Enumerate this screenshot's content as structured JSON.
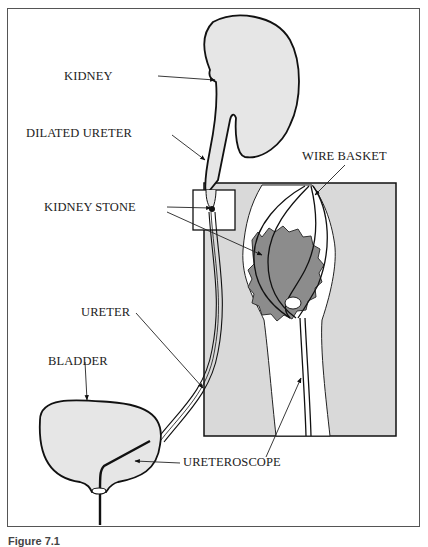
{
  "figure": {
    "type": "anatomical-diagram",
    "caption": "Figure 7.1",
    "colors": {
      "organ_fill": "#e6e6e6",
      "inset_fill": "#d9d9d9",
      "stone_fill": "#8c8c8c",
      "outline": "#111111",
      "background": "#ffffff"
    },
    "labels": {
      "kidney": "KIDNEY",
      "dilated_ureter": "DILATED URETER",
      "kidney_stone": "KIDNEY STONE",
      "wire_basket": "WIRE BASKET",
      "ureter": "URETER",
      "bladder": "BLADDER",
      "ureteroscope": "URETEROSCOPE"
    }
  }
}
